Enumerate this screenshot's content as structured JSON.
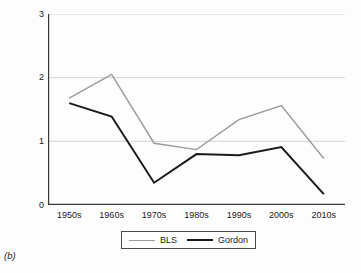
{
  "figure": {
    "panel_label": "(b)",
    "background": "#fdfdfd"
  },
  "chart_data": {
    "type": "line",
    "title": "",
    "subtitle": "",
    "xlabel": "",
    "ylabel": "TFP growth, 10-year averages (%)",
    "categories": [
      "1950s",
      "1960s",
      "1970s",
      "1980s",
      "1990s",
      "2000s",
      "2010s"
    ],
    "series": [
      {
        "name": "BLS",
        "color": "#9a9a9a",
        "values": [
          1.68,
          2.05,
          0.97,
          0.87,
          1.34,
          1.56,
          0.73
        ]
      },
      {
        "name": "Gordon",
        "color": "#1a1a1a",
        "values": [
          1.6,
          1.39,
          0.35,
          0.8,
          0.78,
          0.91,
          0.17
        ]
      }
    ],
    "ylim": [
      0,
      3
    ],
    "yticks": [
      0,
      1,
      2,
      3
    ],
    "ytick_labels": [
      "0",
      "1",
      "2",
      "3"
    ],
    "grid": true,
    "grid_axis": "y",
    "grid_color": "#c8c8c8",
    "axis_color": "#3a3a3a",
    "legend_position": "below-center",
    "legend_entries": [
      "BLS",
      "Gordon"
    ]
  }
}
